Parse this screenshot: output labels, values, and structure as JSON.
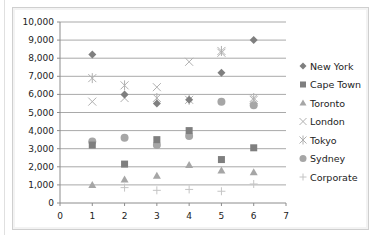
{
  "chart_data": {
    "type": "scatter",
    "title": "",
    "xlabel": "",
    "ylabel": "",
    "xlim": [
      0,
      7
    ],
    "ylim": [
      0,
      10000
    ],
    "x_ticks": [
      "0",
      "1",
      "2",
      "3",
      "4",
      "5",
      "6",
      "7"
    ],
    "y_ticks": [
      "0",
      "1,000",
      "2,000",
      "3,000",
      "4,000",
      "5,000",
      "6,000",
      "7,000",
      "8,000",
      "9,000",
      "10,000"
    ],
    "grid": "horizontal",
    "legend_position": "right",
    "x": [
      1,
      2,
      3,
      4,
      5,
      6
    ],
    "series": [
      {
        "name": "New York",
        "marker": "diamond",
        "color": "#7f7f7f",
        "values": [
          8200,
          6000,
          5500,
          5700,
          7200,
          9000
        ]
      },
      {
        "name": "Cape Town",
        "marker": "square",
        "color": "#7f7f7f",
        "values": [
          3200,
          2150,
          3500,
          4000,
          2400,
          3050
        ]
      },
      {
        "name": "Toronto",
        "marker": "triangle",
        "color": "#a6a6a6",
        "values": [
          1000,
          1300,
          1500,
          2100,
          1800,
          1700
        ]
      },
      {
        "name": "London",
        "marker": "x",
        "color": "#b0b0b0",
        "values": [
          5600,
          5800,
          6400,
          7800,
          8300,
          5700
        ]
      },
      {
        "name": "Tokyo",
        "marker": "star",
        "color": "#b0b0b0",
        "values": [
          6900,
          6500,
          5800,
          5700,
          8400,
          5800
        ]
      },
      {
        "name": "Sydney",
        "marker": "circle",
        "color": "#a6a6a6",
        "values": [
          3400,
          3600,
          3200,
          3700,
          5600,
          5400
        ]
      },
      {
        "name": "Corporate",
        "marker": "plus",
        "color": "#c4c4c4",
        "values": [
          null,
          850,
          700,
          750,
          650,
          1050
        ]
      }
    ]
  },
  "legend": {
    "items": [
      "New York",
      "Cape Town",
      "Toronto",
      "London",
      "Tokyo",
      "Sydney",
      "Corporate"
    ]
  }
}
